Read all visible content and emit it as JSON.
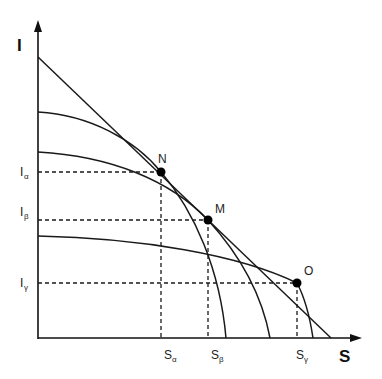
{
  "axes": {
    "y_label": "I",
    "x_label": "S"
  },
  "points": [
    {
      "name": "N",
      "label": "N"
    },
    {
      "name": "M",
      "label": "M"
    },
    {
      "name": "O",
      "label": "O"
    }
  ],
  "y_ticks": [
    {
      "main": "I",
      "sub": "α"
    },
    {
      "main": "I",
      "sub": "β"
    },
    {
      "main": "I",
      "sub": "γ"
    }
  ],
  "x_ticks": [
    {
      "main": "S",
      "sub": "α"
    },
    {
      "main": "S",
      "sub": "β"
    },
    {
      "main": "S",
      "sub": "γ"
    }
  ]
}
